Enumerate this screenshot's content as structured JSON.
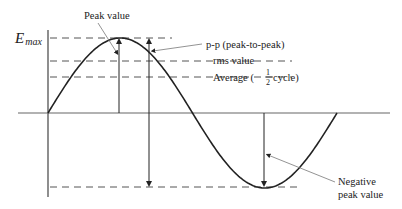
{
  "diagram": {
    "axis_label": {
      "symbol": "E",
      "subscript": "max"
    },
    "labels": {
      "peak": "Peak value",
      "pp": "p-p (peak-to-peak)",
      "rms": "rms value",
      "average_prefix": "Average (",
      "average_frac_num": "1",
      "average_frac_den": "2",
      "average_suffix": " cycle)",
      "negative_line1": "Negative",
      "negative_line2": "peak value"
    },
    "colors": {
      "ink": "#222222",
      "dash": "#555555",
      "leader": "#777777"
    }
  }
}
